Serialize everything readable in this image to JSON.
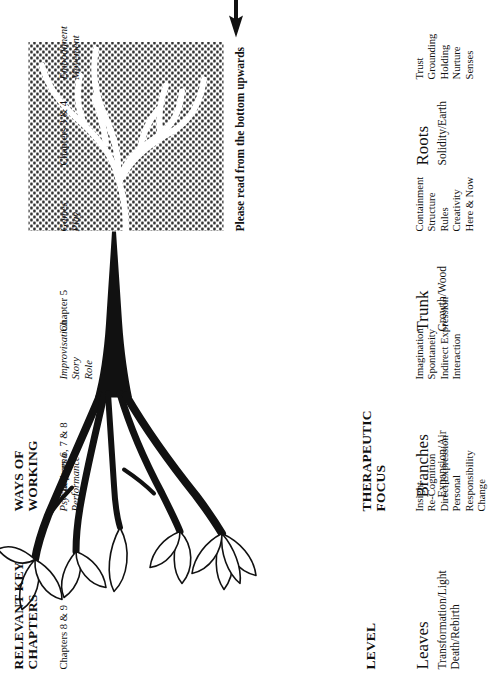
{
  "diagram": {
    "note": "Please read from the bottom upwards",
    "columns": [
      {
        "key": "level",
        "header": "LEVEL"
      },
      {
        "key": "focus",
        "header": "THERAPEUTIC\nFOCUS"
      },
      {
        "key": "ways",
        "header": "WAYS OF\nWORKING"
      },
      {
        "key": "chapters",
        "header": "RELEVANT KEY\nCHAPTERS"
      }
    ],
    "rows": [
      {
        "level": "Leaves",
        "level_sub": "Transformation/Light\nDeath/Rebirth",
        "focus": "Insight\nRe-Cognition\nDirect Expression\nPersonal\n   Responsibility\nChange",
        "ways": "Psychodrama\nPerformance",
        "chapters": "Chapters 8 & 9"
      },
      {
        "level": "Branches",
        "level_sub": "Expansion/Air",
        "focus": "Imagination\nSpontaneity\nIndirect Expression\nInteraction",
        "ways": "Improvisation\nStory\nRole",
        "chapters": "Chapters 6, 7 & 8"
      },
      {
        "level": "Trunk",
        "level_sub": "Growth/Wood",
        "focus": "Containment\nStructure\nRules\nCreativity\nHere & Now",
        "ways": "Games\nPlay",
        "chapters": "Chapter 5"
      },
      {
        "level": "Roots",
        "level_sub": "Solidity/Earth",
        "focus": "Trust\nGrounding\nHolding\nNurture\nSenses",
        "ways": "Embodiment\nMovement",
        "chapters": "Chapters 3 & 4"
      }
    ],
    "colors": {
      "ink": "#111111",
      "paper": "#ffffff",
      "soil_stipple": "#2b2b2b"
    }
  }
}
